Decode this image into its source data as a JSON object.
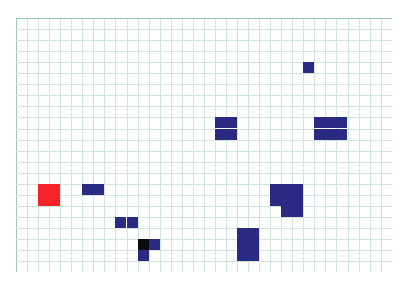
{
  "board": {
    "title": "Grid Board",
    "origin_x": 16,
    "origin_y": 18,
    "cell_size": 11.05,
    "columns": 34,
    "rows": 23,
    "background_color": "#ffffff",
    "grid_line_color": "#cfe6dd",
    "grid_line_major_color": "#a9cfc4",
    "grid_border_color": "#9dc7bb"
  },
  "palette": {
    "navy": "#2a2a82",
    "red": "#f42229",
    "black": "#0b0b0b"
  },
  "pieces": [
    {
      "id": "piece-single-top-right",
      "label": "single",
      "color": "#2a2a82",
      "cells": [
        [
          26,
          4
        ]
      ]
    },
    {
      "id": "piece-square-center",
      "label": "square",
      "color": "#2a2a82",
      "cells": [
        [
          18,
          9
        ],
        [
          19,
          9
        ],
        [
          18,
          10
        ],
        [
          19,
          10
        ]
      ]
    },
    {
      "id": "piece-rect-right",
      "label": "rectangle",
      "color": "#2a2a82",
      "cells": [
        [
          27,
          9
        ],
        [
          28,
          9
        ],
        [
          29,
          9
        ],
        [
          27,
          10
        ],
        [
          28,
          10
        ],
        [
          29,
          10
        ]
      ]
    },
    {
      "id": "piece-red-square",
      "label": "target",
      "color": "#f42229",
      "cells": [
        [
          2,
          15
        ],
        [
          3,
          15
        ],
        [
          2,
          16
        ],
        [
          3,
          16
        ]
      ]
    },
    {
      "id": "piece-domino-left-upper",
      "label": "domino",
      "color": "#2a2a82",
      "cells": [
        [
          6,
          15
        ],
        [
          7,
          15
        ]
      ]
    },
    {
      "id": "piece-domino-left-lower",
      "label": "domino",
      "color": "#2a2a82",
      "cells": [
        [
          9,
          18
        ],
        [
          10,
          18
        ]
      ]
    },
    {
      "id": "piece-p-pentomino-right",
      "label": "pentomino",
      "color": "#2a2a82",
      "cells": [
        [
          23,
          15
        ],
        [
          24,
          15
        ],
        [
          25,
          15
        ],
        [
          23,
          16
        ],
        [
          24,
          16
        ],
        [
          25,
          16
        ],
        [
          24,
          17
        ],
        [
          25,
          17
        ]
      ]
    },
    {
      "id": "piece-black-corner",
      "label": "blocked",
      "color": "#0b0b0b",
      "cells": [
        [
          11,
          20
        ]
      ]
    },
    {
      "id": "piece-corner-navy",
      "label": "corner",
      "color": "#2a2a82",
      "cells": [
        [
          12,
          20
        ],
        [
          11,
          21
        ]
      ]
    },
    {
      "id": "piece-tall-bottom",
      "label": "tall",
      "color": "#2a2a82",
      "cells": [
        [
          20,
          19
        ],
        [
          21,
          19
        ],
        [
          20,
          20
        ],
        [
          21,
          20
        ],
        [
          20,
          21
        ],
        [
          21,
          21
        ]
      ]
    }
  ]
}
